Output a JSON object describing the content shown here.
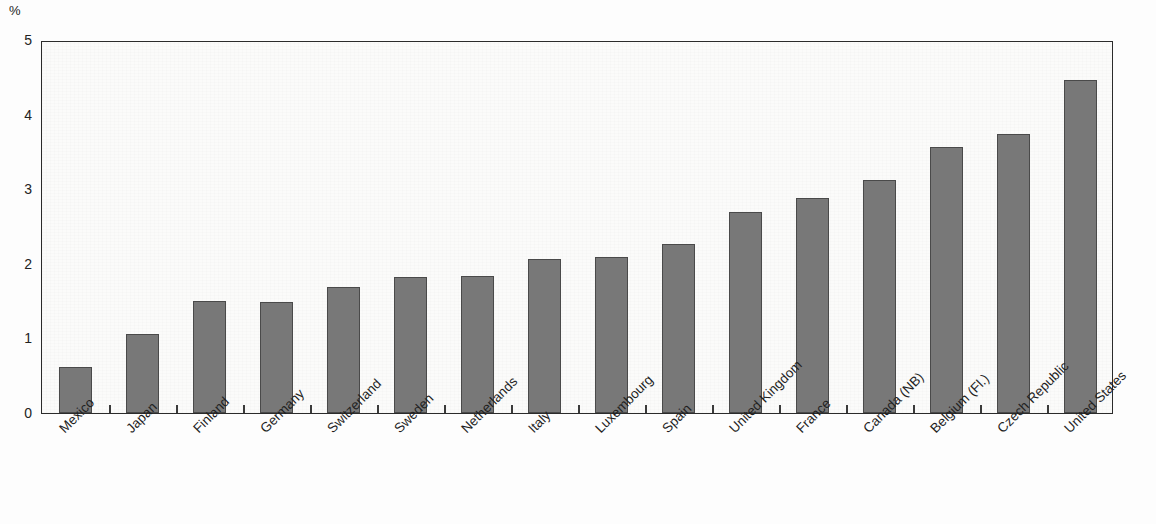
{
  "chart_data": {
    "type": "bar",
    "title": "",
    "subtitle": "",
    "xlabel": "",
    "ylabel": "%",
    "unit_label": "%",
    "ylim": [
      0,
      5
    ],
    "ytick_labels": [
      "0",
      "1",
      "2",
      "3",
      "4",
      "5"
    ],
    "ytick_values": [
      0,
      1,
      2,
      3,
      4,
      5
    ],
    "grid": false,
    "legend": null,
    "bar_color": "#787878",
    "bar_edge_color": "#4a4a4a",
    "axis_color": "#2b2b2b",
    "background_color": "#fbfbfa",
    "categories": [
      "Mexico",
      "Japan",
      "Finland",
      "Germany",
      "Switzerland",
      "Sweden",
      "Netherlands",
      "Italy",
      "Luxembourg",
      "Spain",
      "United Kingdom",
      "France",
      "Canada (NB)",
      "Belgium (Fl.)",
      "Czech Republic",
      "United States"
    ],
    "values": [
      0.62,
      1.06,
      1.5,
      1.49,
      1.69,
      1.82,
      1.84,
      2.07,
      2.09,
      2.26,
      2.69,
      2.88,
      3.13,
      3.56,
      3.74,
      4.47
    ],
    "label_rotation_deg": -45
  }
}
